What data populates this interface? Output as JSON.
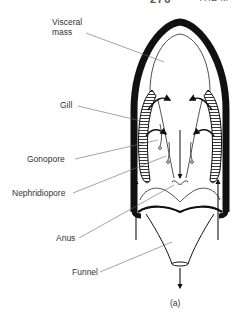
{
  "header": {
    "page_number": "276",
    "running_title": "THE M"
  },
  "diagram": {
    "labels": {
      "visceral_mass_line1": "Visceral",
      "visceral_mass_line2": "mass",
      "gill": "Gill",
      "gonopore": "Gonopore",
      "nephridiopore": "Nephridiopore",
      "anus": "Anus",
      "funnel": "Funnel"
    },
    "caption": "(a)",
    "colors": {
      "ink": "#111111",
      "leader": "#555555",
      "background": "#ffffff"
    }
  }
}
